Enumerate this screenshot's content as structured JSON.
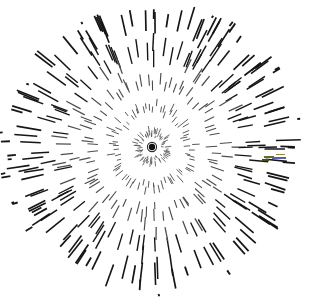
{
  "figure": {
    "type": "radial-burst",
    "canvas": {
      "width": 311,
      "height": 297,
      "background": "#ffffff"
    },
    "center": {
      "x": 152,
      "y": 147
    },
    "center_dot": {
      "radius": 3.2,
      "ring_radius": 4.6,
      "color": "#111111",
      "ring_color": "#2a2a2a"
    },
    "geometry": {
      "ray_count": 72,
      "radius_x": 143,
      "radius_y": 139,
      "radius_jitter": 9,
      "inner_gap": 9,
      "dash_min_length": 4,
      "dash_max_length": 29,
      "dash_min_gap": 9,
      "dash_max_gap": 20,
      "stroke_min_width": 0.8,
      "stroke_max_width": 1.9,
      "angle_jitter_deg": 2.6,
      "lateral_jitter": 2.2,
      "ink_color": "#161616",
      "ink_light": "#4d4d4d"
    },
    "bounds": {
      "left": 12,
      "top": 13,
      "right": 296,
      "bottom": 286
    },
    "stray_marks": [
      {
        "x": 264,
        "y": 156,
        "w": 10,
        "h": 2,
        "color": "#6b6b24"
      },
      {
        "x": 272,
        "y": 157,
        "w": 14,
        "h": 2,
        "color": "#5a5fb0"
      },
      {
        "x": 262,
        "y": 159,
        "w": 7,
        "h": 2,
        "color": "#3f4f20"
      },
      {
        "x": 276,
        "y": 154,
        "w": 9,
        "h": 1,
        "color": "#8a8a3a"
      }
    ]
  },
  "chart_data": {
    "type": "scatter",
    "subtitle": "",
    "xlabel": "",
    "ylabel": "",
    "legend": [],
    "annotations": [],
    "grid": false,
    "xlim": [
      0,
      311
    ],
    "ylim": [
      0,
      297
    ],
    "series": [
      {
        "name": "rays",
        "count": 72,
        "angles_deg": [
          0,
          5,
          10,
          15,
          20,
          25,
          30,
          35,
          40,
          45,
          50,
          55,
          60,
          65,
          70,
          75,
          80,
          85,
          90,
          95,
          100,
          105,
          110,
          115,
          120,
          125,
          130,
          135,
          140,
          145,
          150,
          155,
          160,
          165,
          170,
          175,
          180,
          185,
          190,
          195,
          200,
          205,
          210,
          215,
          220,
          225,
          230,
          235,
          240,
          245,
          250,
          255,
          260,
          265,
          270,
          275,
          280,
          285,
          290,
          295,
          300,
          305,
          310,
          315,
          320,
          325,
          330,
          335,
          340,
          345,
          350,
          355
        ]
      }
    ]
  }
}
